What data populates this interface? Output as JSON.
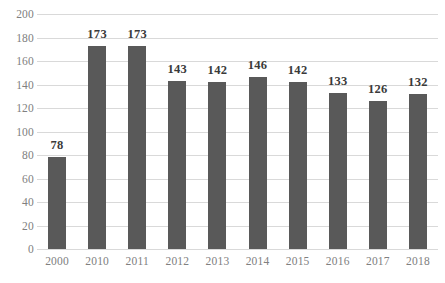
{
  "chart_data": {
    "type": "bar",
    "title": "",
    "subtitle": "",
    "xlabel": "",
    "ylabel": "",
    "categories": [
      "2000",
      "2010",
      "2011",
      "2012",
      "2013",
      "2014",
      "2015",
      "2016",
      "2017",
      "2018"
    ],
    "values": [
      78,
      173,
      173,
      143,
      142,
      146,
      142,
      133,
      126,
      132
    ],
    "data_labels": [
      "78",
      "173",
      "173",
      "143",
      "142",
      "146",
      "142",
      "133",
      "126",
      "132"
    ],
    "ylim": [
      0,
      200
    ],
    "y_ticks": [
      0,
      20,
      40,
      60,
      80,
      100,
      120,
      140,
      160,
      180,
      200
    ],
    "y_tick_labels": [
      "0",
      "20",
      "40",
      "60",
      "80",
      "100",
      "120",
      "140",
      "160",
      "180",
      "200"
    ],
    "grid": true,
    "grid_axis": "y",
    "legend": false,
    "legend_position": "none",
    "series": [
      {
        "name": "",
        "values": [
          78,
          173,
          173,
          143,
          142,
          146,
          142,
          133,
          126,
          132
        ]
      }
    ],
    "colors": {
      "bar": "#595959",
      "gridline": "#d9d9d9",
      "axis_text": "#808080",
      "data_label_text": "#3a3a3a",
      "background": "#ffffff"
    }
  }
}
